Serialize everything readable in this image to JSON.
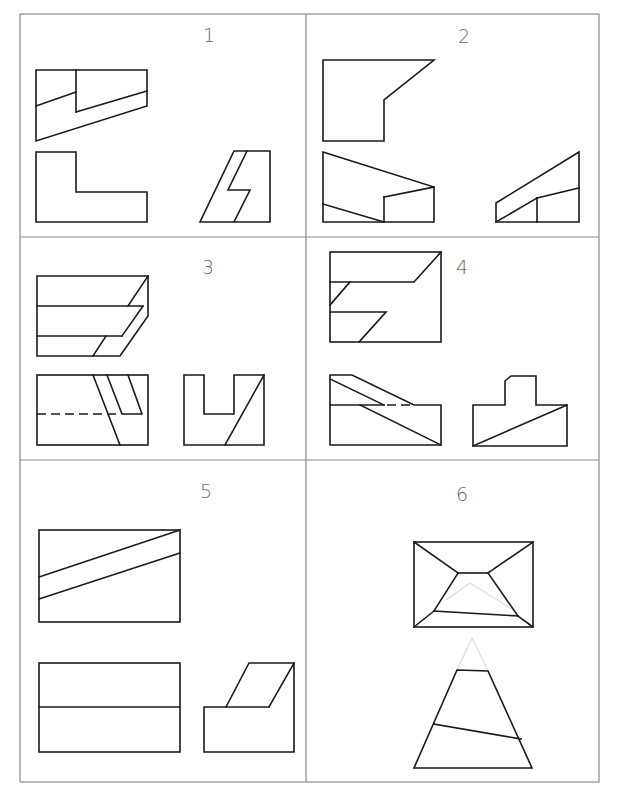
{
  "sheet": {
    "title": "Orthographic projection exercises",
    "line_color": "#1a1a1a",
    "grid_color": "#8a8a8a",
    "panels": [
      {
        "number": "1",
        "views": [
          "top-view",
          "front-view",
          "side-view"
        ]
      },
      {
        "number": "2",
        "views": [
          "top-view",
          "front-view",
          "side-view"
        ]
      },
      {
        "number": "3",
        "views": [
          "top-view",
          "front-view",
          "side-view"
        ]
      },
      {
        "number": "4",
        "views": [
          "top-view",
          "front-view",
          "side-view"
        ]
      },
      {
        "number": "5",
        "views": [
          "top-view",
          "front-view",
          "side-view"
        ]
      },
      {
        "number": "6",
        "views": [
          "top-view",
          "front-view"
        ]
      }
    ]
  }
}
